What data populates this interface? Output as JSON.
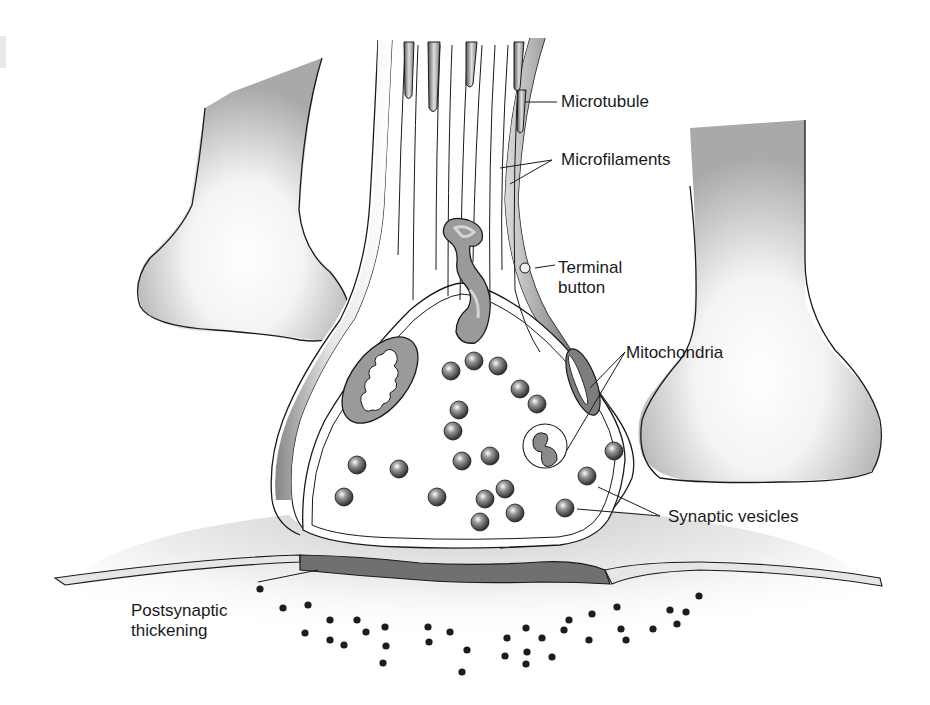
{
  "figure": {
    "colors": {
      "background": "#ffffff",
      "outline": "#1a1a1a",
      "membrane_gray": "#9a9a9a",
      "dendrite_gray": "#a8a8a8",
      "vesicle_dark": "#3a3a3a",
      "thickening": "#6e6e6e",
      "receptor_dot": "#1c1c1c"
    }
  },
  "labels": {
    "microtubule": "Microtubule",
    "microfilaments": "Microfilaments",
    "terminal_button_line1": "Terminal",
    "terminal_button_line2": "button",
    "mitochondria": "Mitochondria",
    "synaptic_vesicles": "Synaptic vesicles",
    "postsynaptic_line1": "Postsynaptic",
    "postsynaptic_line2": "thickening"
  }
}
